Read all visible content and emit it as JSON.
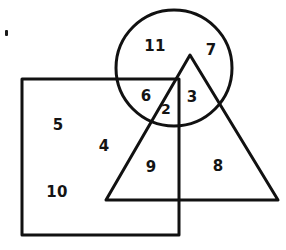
{
  "figure": {
    "kind": "overlapping-shapes-region-diagram",
    "background_color": "#ffffff",
    "stroke_color": "#111111",
    "label_color": "#141414",
    "width": 286,
    "height": 250
  },
  "shapes": [
    {
      "id": "square",
      "name": "square",
      "type": "rect",
      "x": 22,
      "y": 79,
      "width": 157,
      "height": 156,
      "stroke_width": 3
    },
    {
      "id": "circle",
      "name": "circle",
      "type": "circle",
      "cx": 174,
      "cy": 68,
      "r": 58,
      "stroke_width": 3
    },
    {
      "id": "triangle",
      "name": "triangle",
      "type": "polygon",
      "points": "190,55 278,200 106,200",
      "stroke_width": 3
    }
  ],
  "regions": [
    {
      "id": "r11",
      "label": "11",
      "x": 155,
      "y": 46,
      "membership": "circle only (left of triangle, above square)"
    },
    {
      "id": "r7",
      "label": "7",
      "x": 211,
      "y": 50,
      "membership": "circle only (right of triangle)"
    },
    {
      "id": "r6",
      "label": "6",
      "x": 146,
      "y": 96,
      "membership": "circle and square"
    },
    {
      "id": "r2",
      "label": "2",
      "x": 166,
      "y": 109,
      "membership": "circle and square and triangle"
    },
    {
      "id": "r3",
      "label": "3",
      "x": 192,
      "y": 97,
      "membership": "circle and triangle"
    },
    {
      "id": "r5",
      "label": "5",
      "x": 58,
      "y": 125,
      "membership": "square only"
    },
    {
      "id": "r4",
      "label": "4",
      "x": 104,
      "y": 146,
      "membership": "square only"
    },
    {
      "id": "r9",
      "label": "9",
      "x": 151,
      "y": 167,
      "membership": "square and triangle"
    },
    {
      "id": "r8",
      "label": "8",
      "x": 218,
      "y": 166,
      "membership": "triangle only"
    },
    {
      "id": "r10",
      "label": "10",
      "x": 57,
      "y": 192,
      "membership": "square only"
    }
  ],
  "marks": [
    {
      "id": "speck-top-left",
      "name": "ink-speck",
      "x": 5,
      "y": 30,
      "width": 3,
      "height": 6
    }
  ]
}
